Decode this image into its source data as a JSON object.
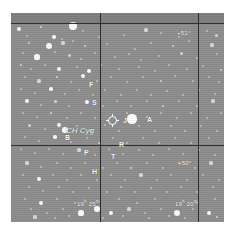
{
  "chart": {
    "type": "star-chart",
    "plate_color": "#8d8d8d",
    "star_color": "#fbfbfb",
    "grid_color": "#2b2b2b",
    "label_color": "#ffffff"
  },
  "target": {
    "name": "CH Cyg",
    "marker": "circled-crosshair",
    "x": 97,
    "y": 103
  },
  "axes": {
    "dec_labels": [
      {
        "text": "+51°",
        "x": 166,
        "y": 17
      },
      {
        "text": "+50°",
        "x": 167,
        "y": 147
      }
    ],
    "ra_labels": [
      {
        "text": "19",
        "sup1": "h",
        "mid": " 25",
        "sup2": "m",
        "x": 66,
        "y": 188
      },
      {
        "text": "19",
        "sup1": "h",
        "mid": " 20",
        "sup2": "m",
        "x": 164,
        "y": 188
      }
    ]
  },
  "grid": {
    "horizontal": [
      10,
      132
    ],
    "vertical": [
      89,
      187
    ]
  },
  "star_labels": [
    {
      "id": "F",
      "text": "F",
      "x": 78,
      "y": 68
    },
    {
      "id": "S",
      "text": "S",
      "x": 81,
      "y": 86
    },
    {
      "id": "J",
      "text": "J",
      "x": 112,
      "y": 104
    },
    {
      "id": "A",
      "text": "A",
      "x": 136,
      "y": 103
    },
    {
      "id": "B",
      "text": "B",
      "x": 54,
      "y": 121
    },
    {
      "id": "R",
      "text": "R",
      "x": 108,
      "y": 128
    },
    {
      "id": "P",
      "text": "P",
      "x": 73,
      "y": 136
    },
    {
      "id": "T",
      "text": "T",
      "x": 100,
      "y": 140
    },
    {
      "id": "H",
      "text": "H",
      "x": 81,
      "y": 155
    }
  ],
  "chart_data": {
    "type": "scatter",
    "xlabel": "Right Ascension",
    "ylabel": "Declination",
    "xlim": [
      "19h 27m",
      "19h 18m"
    ],
    "ylim": [
      "+49.6",
      "+51.3"
    ],
    "grid": true,
    "legend": "none",
    "annotations": [
      "CH Cyg",
      "F",
      "S",
      "J",
      "A",
      "B",
      "R",
      "P",
      "T",
      "H"
    ],
    "tick_labels_x": [
      "19h 25m",
      "19h 20m"
    ],
    "tick_labels_y": [
      "+51°",
      "+50°"
    ],
    "stars": [
      [
        8,
        16,
        2.0
      ],
      [
        30,
        14,
        1.4
      ],
      [
        62,
        13,
        4.0
      ],
      [
        72,
        18,
        1.2
      ],
      [
        16,
        23,
        1.2
      ],
      [
        43,
        24,
        1.8
      ],
      [
        51,
        26,
        1.2
      ],
      [
        88,
        24,
        1.1
      ],
      [
        113,
        22,
        1.1
      ],
      [
        135,
        17,
        1.6
      ],
      [
        150,
        20,
        1.1
      ],
      [
        168,
        24,
        1.1
      ],
      [
        196,
        18,
        1.1
      ],
      [
        205,
        22,
        1.5
      ],
      [
        18,
        30,
        1.3
      ],
      [
        38,
        33,
        3.2
      ],
      [
        52,
        30,
        1.6
      ],
      [
        62,
        28,
        1.2
      ],
      [
        74,
        33,
        1.4
      ],
      [
        96,
        31,
        1.2
      ],
      [
        124,
        36,
        1.1
      ],
      [
        140,
        30,
        1.2
      ],
      [
        162,
        33,
        1.3
      ],
      [
        178,
        28,
        1.1
      ],
      [
        201,
        32,
        1.6
      ],
      [
        12,
        40,
        1.2
      ],
      [
        26,
        44,
        2.6
      ],
      [
        44,
        39,
        1.1
      ],
      [
        58,
        42,
        1.5
      ],
      [
        70,
        46,
        1.1
      ],
      [
        84,
        40,
        1.2
      ],
      [
        104,
        44,
        1.2
      ],
      [
        118,
        41,
        1.1
      ],
      [
        130,
        47,
        1.1
      ],
      [
        148,
        43,
        1.2
      ],
      [
        170,
        40,
        1.5
      ],
      [
        186,
        45,
        1.1
      ],
      [
        206,
        41,
        1.2
      ],
      [
        10,
        52,
        1.3
      ],
      [
        20,
        56,
        1.2
      ],
      [
        34,
        52,
        1.2
      ],
      [
        48,
        56,
        2.2
      ],
      [
        66,
        54,
        1.1
      ],
      [
        78,
        58,
        2.4
      ],
      [
        90,
        52,
        1.2
      ],
      [
        108,
        56,
        1.1
      ],
      [
        128,
        54,
        1.2
      ],
      [
        144,
        58,
        1.1
      ],
      [
        158,
        52,
        1.2
      ],
      [
        176,
        56,
        1.2
      ],
      [
        192,
        53,
        1.1
      ],
      [
        210,
        57,
        1.3
      ],
      [
        14,
        64,
        1.2
      ],
      [
        28,
        68,
        1.6
      ],
      [
        46,
        64,
        1.3
      ],
      [
        60,
        69,
        1.2
      ],
      [
        72,
        63,
        2.2
      ],
      [
        86,
        68,
        1.2
      ],
      [
        100,
        64,
        1.2
      ],
      [
        116,
        69,
        1.1
      ],
      [
        132,
        64,
        1.2
      ],
      [
        150,
        68,
        1.4
      ],
      [
        164,
        63,
        1.1
      ],
      [
        182,
        68,
        1.2
      ],
      [
        198,
        64,
        1.2
      ],
      [
        208,
        69,
        1.1
      ],
      [
        10,
        76,
        1.2
      ],
      [
        24,
        80,
        1.2
      ],
      [
        40,
        76,
        1.8
      ],
      [
        54,
        81,
        1.2
      ],
      [
        68,
        77,
        1.2
      ],
      [
        82,
        82,
        1.2
      ],
      [
        94,
        77,
        1.1
      ],
      [
        110,
        82,
        1.1
      ],
      [
        126,
        77,
        1.2
      ],
      [
        140,
        82,
        1.2
      ],
      [
        156,
        78,
        1.1
      ],
      [
        172,
        82,
        1.2
      ],
      [
        188,
        77,
        1.2
      ],
      [
        204,
        81,
        1.2
      ],
      [
        16,
        88,
        2.0
      ],
      [
        30,
        92,
        1.2
      ],
      [
        44,
        88,
        1.5
      ],
      [
        58,
        93,
        1.2
      ],
      [
        76,
        89,
        2.2
      ],
      [
        92,
        93,
        1.1
      ],
      [
        106,
        88,
        1.2
      ],
      [
        120,
        93,
        1.1
      ],
      [
        136,
        88,
        1.2
      ],
      [
        152,
        93,
        1.3
      ],
      [
        168,
        88,
        1.2
      ],
      [
        186,
        93,
        1.2
      ],
      [
        202,
        88,
        1.6
      ],
      [
        12,
        100,
        1.2
      ],
      [
        26,
        104,
        1.2
      ],
      [
        40,
        100,
        1.4
      ],
      [
        56,
        105,
        1.1
      ],
      [
        70,
        100,
        1.2
      ],
      [
        84,
        105,
        1.1
      ],
      [
        116,
        100,
        1.2
      ],
      [
        121,
        106,
        4.6
      ],
      [
        136,
        104,
        1.1
      ],
      [
        150,
        100,
        1.2
      ],
      [
        166,
        105,
        1.2
      ],
      [
        180,
        100,
        1.2
      ],
      [
        196,
        105,
        1.2
      ],
      [
        210,
        100,
        1.2
      ],
      [
        18,
        112,
        1.5
      ],
      [
        34,
        116,
        1.2
      ],
      [
        48,
        112,
        2.2
      ],
      [
        54,
        117,
        2.8
      ],
      [
        66,
        113,
        1.2
      ],
      [
        80,
        118,
        1.1
      ],
      [
        94,
        112,
        1.1
      ],
      [
        108,
        118,
        1.1
      ],
      [
        128,
        113,
        1.2
      ],
      [
        144,
        118,
        1.2
      ],
      [
        160,
        113,
        1.2
      ],
      [
        174,
        118,
        1.1
      ],
      [
        190,
        113,
        1.2
      ],
      [
        206,
        118,
        1.2
      ],
      [
        14,
        124,
        1.2
      ],
      [
        28,
        128,
        1.2
      ],
      [
        44,
        124,
        1.8
      ],
      [
        60,
        129,
        1.2
      ],
      [
        76,
        125,
        1.2
      ],
      [
        88,
        130,
        1.4
      ],
      [
        102,
        125,
        1.1
      ],
      [
        116,
        130,
        1.2
      ],
      [
        132,
        125,
        1.2
      ],
      [
        148,
        130,
        1.1
      ],
      [
        164,
        125,
        1.2
      ],
      [
        180,
        130,
        1.2
      ],
      [
        198,
        125,
        1.2
      ],
      [
        10,
        136,
        1.2
      ],
      [
        24,
        140,
        1.2
      ],
      [
        38,
        136,
        1.2
      ],
      [
        52,
        141,
        1.2
      ],
      [
        68,
        137,
        1.6
      ],
      [
        84,
        142,
        1.2
      ],
      [
        98,
        136,
        1.2
      ],
      [
        112,
        141,
        1.1
      ],
      [
        128,
        137,
        1.2
      ],
      [
        142,
        142,
        1.2
      ],
      [
        158,
        136,
        1.2
      ],
      [
        172,
        141,
        1.2
      ],
      [
        188,
        137,
        1.2
      ],
      [
        204,
        142,
        1.2
      ],
      [
        16,
        150,
        1.6
      ],
      [
        30,
        154,
        1.2
      ],
      [
        46,
        150,
        1.2
      ],
      [
        60,
        155,
        1.2
      ],
      [
        74,
        150,
        1.2
      ],
      [
        92,
        155,
        1.1
      ],
      [
        106,
        150,
        1.2
      ],
      [
        120,
        155,
        1.4
      ],
      [
        136,
        150,
        1.2
      ],
      [
        152,
        155,
        1.2
      ],
      [
        168,
        150,
        1.2
      ],
      [
        184,
        155,
        1.2
      ],
      [
        200,
        150,
        1.6
      ],
      [
        12,
        162,
        1.2
      ],
      [
        28,
        166,
        2.0
      ],
      [
        42,
        162,
        1.2
      ],
      [
        56,
        167,
        1.2
      ],
      [
        70,
        162,
        1.2
      ],
      [
        86,
        167,
        1.2
      ],
      [
        100,
        162,
        1.2
      ],
      [
        114,
        167,
        1.2
      ],
      [
        130,
        162,
        1.6
      ],
      [
        146,
        167,
        1.2
      ],
      [
        160,
        162,
        1.2
      ],
      [
        176,
        167,
        1.2
      ],
      [
        192,
        162,
        1.2
      ],
      [
        208,
        167,
        1.2
      ],
      [
        18,
        174,
        1.2
      ],
      [
        32,
        178,
        1.2
      ],
      [
        48,
        174,
        1.2
      ],
      [
        62,
        179,
        1.2
      ],
      [
        78,
        175,
        1.2
      ],
      [
        96,
        179,
        1.2
      ],
      [
        110,
        174,
        1.2
      ],
      [
        124,
        179,
        1.2
      ],
      [
        140,
        175,
        1.2
      ],
      [
        156,
        179,
        1.2
      ],
      [
        170,
        174,
        1.2
      ],
      [
        186,
        179,
        1.2
      ],
      [
        202,
        174,
        1.2
      ],
      [
        14,
        186,
        1.2
      ],
      [
        30,
        190,
        2.4
      ],
      [
        46,
        186,
        1.2
      ],
      [
        64,
        190,
        1.2
      ],
      [
        108,
        186,
        1.2
      ],
      [
        126,
        190,
        1.2
      ],
      [
        144,
        186,
        1.2
      ],
      [
        186,
        190,
        1.2
      ],
      [
        204,
        186,
        1.2
      ],
      [
        20,
        196,
        1.2
      ],
      [
        36,
        200,
        1.2
      ],
      [
        52,
        196,
        1.2
      ],
      [
        70,
        200,
        2.6
      ],
      [
        86,
        196,
        2.8
      ],
      [
        100,
        200,
        2.0
      ],
      [
        118,
        196,
        1.6
      ],
      [
        134,
        200,
        1.2
      ],
      [
        150,
        196,
        1.2
      ],
      [
        166,
        200,
        3.4
      ],
      [
        182,
        196,
        1.2
      ],
      [
        198,
        200,
        2.4
      ],
      [
        24,
        204,
        1.6
      ],
      [
        44,
        205,
        1.2
      ],
      [
        58,
        203,
        1.2
      ],
      [
        92,
        205,
        1.2
      ],
      [
        112,
        203,
        1.2
      ],
      [
        138,
        205,
        1.2
      ],
      [
        158,
        203,
        1.2
      ],
      [
        174,
        205,
        1.2
      ],
      [
        206,
        204,
        1.4
      ]
    ]
  }
}
